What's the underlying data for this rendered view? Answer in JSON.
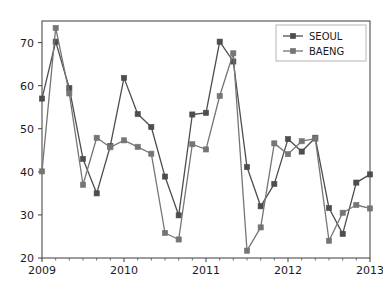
{
  "chart_data": {
    "type": "line",
    "title": "",
    "xlabel": "",
    "ylabel": "",
    "xlim": [
      2009.0,
      2013.0
    ],
    "ylim": [
      20,
      75
    ],
    "yticks": [
      20,
      30,
      40,
      50,
      60,
      70
    ],
    "xticks": [
      2009,
      2010,
      2011,
      2012,
      2013
    ],
    "xtick_labels": [
      "2009",
      "2010",
      "2011",
      "2012",
      "2013"
    ],
    "ytick_labels": [
      "20",
      "30",
      "40",
      "50",
      "60",
      "70"
    ],
    "minor_xticks_per_year": 6,
    "grid": false,
    "legend_position": "upper right",
    "marker": "square",
    "x": [
      2009.0,
      2009.167,
      2009.333,
      2009.5,
      2009.667,
      2009.833,
      2010.0,
      2010.167,
      2010.333,
      2010.5,
      2010.667,
      2010.833,
      2011.0,
      2011.167,
      2011.333,
      2011.5,
      2011.667,
      2011.833,
      2012.0,
      2012.167,
      2012.333,
      2012.5,
      2012.667,
      2012.833,
      2013.0
    ],
    "series": [
      {
        "name": "SEOUL",
        "color": "#4d4d4d",
        "values": [
          57.0,
          70.2,
          59.4,
          43.0,
          35.0,
          46.0,
          61.8,
          53.4,
          50.4,
          38.9,
          29.9,
          53.3,
          53.7,
          70.2,
          65.6,
          41.1,
          32.0,
          37.2,
          47.6,
          44.7,
          47.9,
          31.6,
          25.6,
          37.5,
          39.4
        ]
      },
      {
        "name": "BAENG",
        "color": "#757575",
        "values": [
          40.1,
          73.4,
          58.2,
          37.0,
          47.9,
          45.7,
          47.3,
          45.8,
          44.2,
          25.8,
          24.3,
          46.4,
          45.2,
          57.6,
          67.5,
          21.7,
          27.1,
          46.6,
          44.1,
          47.1,
          47.7,
          24.0,
          30.5,
          32.3,
          31.5
        ]
      }
    ]
  },
  "legend": {
    "entries": [
      {
        "label": "SEOUL"
      },
      {
        "label": "BAENG"
      }
    ]
  },
  "axes": {
    "spine_color": "#4d4d4d",
    "background": "#ffffff"
  }
}
